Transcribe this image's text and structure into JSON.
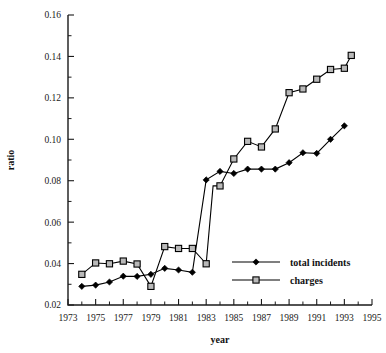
{
  "figure": {
    "background": "#ffffff",
    "ink_color": "#000000",
    "marker_fill_charges": "#b9b9b9"
  },
  "chart_data": {
    "type": "line",
    "title": "",
    "xlabel": "year",
    "ylabel": "ratio",
    "xlim": [
      1973,
      1995
    ],
    "ylim": [
      0.02,
      0.16
    ],
    "grid": false,
    "legend_position": "bottom-right",
    "x_tick_labels": [
      "1973",
      "1975",
      "1977",
      "1979",
      "1981",
      "1983",
      "1985",
      "1987",
      "1989",
      "1991",
      "1993",
      "1995"
    ],
    "x_ticks": [
      1973,
      1975,
      1977,
      1979,
      1981,
      1983,
      1985,
      1987,
      1989,
      1991,
      1993,
      1995
    ],
    "x_minor_ticks": [
      1974,
      1976,
      1978,
      1980,
      1982,
      1984,
      1986,
      1988,
      1990,
      1992,
      1994
    ],
    "y_tick_labels": [
      "0.02",
      "0.04",
      "0.06",
      "0.08",
      "0.10",
      "0.12",
      "0.14",
      "0.16"
    ],
    "y_ticks": [
      0.02,
      0.04,
      0.06,
      0.08,
      0.1,
      0.12,
      0.14,
      0.16
    ],
    "y_minor_ticks": [
      0.03,
      0.05,
      0.07,
      0.09,
      0.11,
      0.13,
      0.15
    ],
    "series": [
      {
        "name": "total incidents",
        "marker": "filled-diamond",
        "x": [
          1974,
          1975,
          1976,
          1977,
          1978,
          1979,
          1980,
          1981,
          1982,
          1983,
          1984,
          1985,
          1986,
          1987,
          1988,
          1989,
          1990,
          1991,
          1992,
          1993
        ],
        "values": [
          0.029,
          0.0296,
          0.0311,
          0.0339,
          0.0338,
          0.0348,
          0.0377,
          0.0369,
          0.0358,
          0.0804,
          0.0845,
          0.0835,
          0.0856,
          0.0856,
          0.0856,
          0.0887,
          0.0935,
          0.0932,
          0.1,
          0.1065
        ]
      },
      {
        "name": "charges",
        "marker": "open-square",
        "x": [
          1974,
          1975,
          1976,
          1977,
          1978,
          1979,
          1980,
          1981,
          1982,
          1983,
          1983.5,
          1984,
          1985,
          1986,
          1987,
          1988,
          1989,
          1990,
          1991,
          1992,
          1993,
          1993.5
        ],
        "values": [
          0.0348,
          0.0403,
          0.0399,
          0.0412,
          0.0398,
          0.029,
          0.0482,
          0.0473,
          0.0473,
          0.0399,
          0.0775,
          0.0775,
          0.0905,
          0.099,
          0.0963,
          0.105,
          0.1225,
          0.1243,
          0.129,
          0.1337,
          0.1343,
          0.1405
        ]
      }
    ]
  },
  "legend": {
    "entries": [
      {
        "label": "total incidents",
        "marker": "filled-diamond"
      },
      {
        "label": "charges",
        "marker": "open-square"
      }
    ]
  }
}
